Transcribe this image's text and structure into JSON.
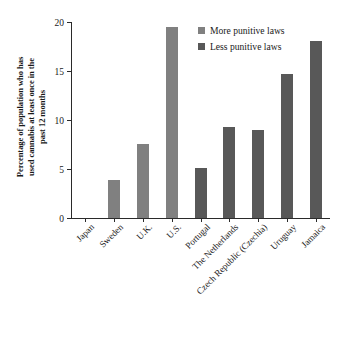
{
  "chart_data": {
    "type": "bar",
    "title": "",
    "xlabel": "",
    "ylabel": "Percentage of population who has used cannabis at least once in the past 12 months",
    "ylabel_lines": [
      "Percentage of population who has",
      "used cannabis at least once in the",
      "past 12 months"
    ],
    "categories": [
      "Japan",
      "Sweden",
      "U.K.",
      "U.S.",
      "Portugal",
      "The Netherlands",
      "Czech Republic (Czechia)",
      "Uruguay",
      "Jamaica"
    ],
    "values": [
      0,
      3.9,
      7.6,
      19.5,
      5.1,
      9.3,
      9.0,
      14.7,
      18.1
    ],
    "groups": [
      "More punitive laws",
      "More punitive laws",
      "More punitive laws",
      "More punitive laws",
      "Less punitive laws",
      "Less punitive laws",
      "Less punitive laws",
      "Less punitive laws",
      "Less punitive laws"
    ],
    "ylim": [
      0,
      20
    ],
    "yticks": [
      0,
      5,
      10,
      15,
      20
    ],
    "ytick_labels": [
      "0",
      "5",
      "10",
      "15",
      "20"
    ],
    "grid": false,
    "legend_position": "top-right",
    "legend": [
      {
        "label": "More punitive laws",
        "color": "#808080"
      },
      {
        "label": "Less punitive laws",
        "color": "#585858"
      }
    ],
    "colors": {
      "more_punitive": "#808080",
      "less_punitive": "#585858",
      "axis": "#2a2a2a",
      "background": "#ffffff"
    }
  }
}
